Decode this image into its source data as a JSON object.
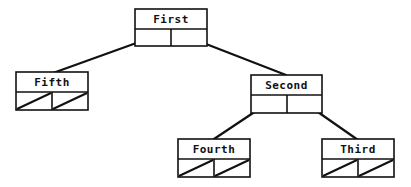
{
  "diagram": {
    "type": "binary-tree",
    "stroke_color": "#111111",
    "background": "#ffffff",
    "nodes": [
      {
        "id": "first",
        "label": "First",
        "x": 135,
        "y": 9,
        "w": 72,
        "h": 37,
        "left": "second-ptr-left",
        "right": "ptr"
      },
      {
        "id": "fifth",
        "label": "Fifth",
        "x": 16,
        "y": 72,
        "w": 72,
        "h": 38,
        "left": "null",
        "right": "null"
      },
      {
        "id": "second",
        "label": "Second",
        "x": 251,
        "y": 75,
        "w": 71,
        "h": 38,
        "left": "ptr",
        "right": "ptr"
      },
      {
        "id": "fourth",
        "label": "Fourth",
        "x": 178,
        "y": 139,
        "w": 72,
        "h": 38,
        "left": "null",
        "right": "null"
      },
      {
        "id": "third",
        "label": "Third",
        "x": 322,
        "y": 139,
        "w": 72,
        "h": 38,
        "left": "null",
        "right": "null"
      }
    ],
    "edges": [
      {
        "from": "first",
        "to": "fifth",
        "x1": 153,
        "y1": 37,
        "x2": 53,
        "y2": 73
      },
      {
        "from": "first",
        "to": "second",
        "x1": 188,
        "y1": 37,
        "x2": 286,
        "y2": 75
      },
      {
        "from": "second",
        "to": "fourth",
        "x1": 268,
        "y1": 103,
        "x2": 214,
        "y2": 139
      },
      {
        "from": "second",
        "to": "third",
        "x1": 305,
        "y1": 103,
        "x2": 358,
        "y2": 140
      }
    ]
  }
}
